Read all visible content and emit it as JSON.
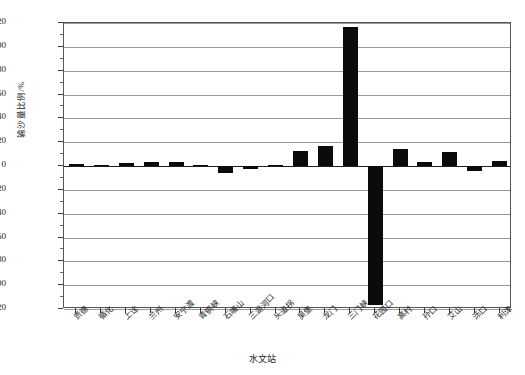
{
  "chart_data": {
    "type": "bar",
    "title": "",
    "xlabel": "水文站",
    "ylabel": "输沙量比例/%",
    "categories": [
      "贵德",
      "循化",
      "上诠",
      "兰州",
      "安宁渡",
      "青铜峡",
      "石嘴山",
      "三湖河口",
      "头道拐",
      "吴堡",
      "龙门",
      "三门峡",
      "花园口",
      "高村",
      "孙口",
      "艾山",
      "泺口",
      "利津"
    ],
    "values": [
      1.5,
      1.0,
      2.5,
      3.5,
      3.5,
      1.0,
      -6.0,
      -2.5,
      0.5,
      13.0,
      17.0,
      117.0,
      -117.0,
      14.0,
      3.0,
      12.0,
      -4.0,
      4.0
    ],
    "ylim": [
      -120,
      120
    ],
    "yticks": [
      120,
      100,
      80,
      60,
      40,
      20,
      0,
      -20,
      -40,
      -60,
      -80,
      -100,
      -120
    ],
    "ytick_labels": [
      "120",
      "100",
      "80",
      "60",
      "40",
      "20",
      "0",
      "-20",
      "-40",
      "-60",
      "-80",
      "-100",
      "-120"
    ],
    "grid": true,
    "legend": "none",
    "series_color": "#0b0b0b"
  }
}
